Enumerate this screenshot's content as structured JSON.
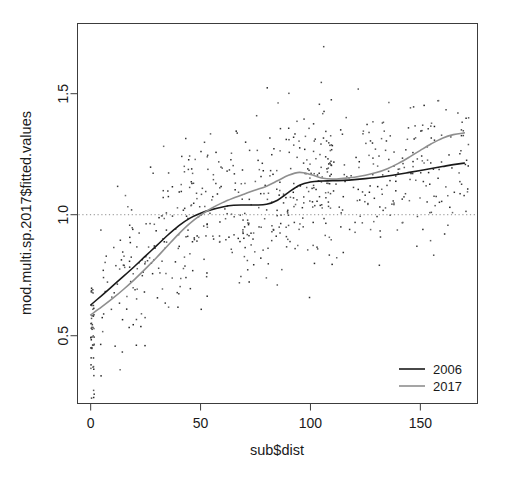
{
  "chart_data": {
    "type": "scatter",
    "title": "",
    "xlabel": "sub$dist",
    "ylabel": "mod.multi.sp.2017$fitted.values",
    "xlim": [
      -6,
      176
    ],
    "ylim": [
      0.22,
      1.79
    ],
    "xticks": [
      0,
      50,
      100,
      150
    ],
    "xtick_labels": [
      "0",
      "50",
      "100",
      "150"
    ],
    "yticks": [
      0.5,
      1.0,
      1.5
    ],
    "ytick_labels": [
      "0.5",
      "1.0",
      "1.5"
    ],
    "grid": false,
    "box": true,
    "reference_line": {
      "name": "unity-reference",
      "orientation": "horizontal",
      "y": 1.0,
      "style": "dotted",
      "color": "#8c8c8c"
    },
    "legend": {
      "position": "bottom-right",
      "entries": [
        {
          "label": "2006",
          "color": "#1a1a1a"
        },
        {
          "label": "2017",
          "color": "#8f8f8f"
        }
      ]
    },
    "series": [
      {
        "name": "2006",
        "type": "line",
        "color": "#1a1a1a",
        "width": 1.6,
        "x": [
          0,
          5,
          10,
          15,
          20,
          25,
          30,
          35,
          40,
          45,
          50,
          55,
          60,
          65,
          70,
          75,
          80,
          85,
          90,
          95,
          100,
          105,
          110,
          115,
          120,
          125,
          130,
          135,
          140,
          145,
          150,
          155,
          160,
          165,
          170
        ],
        "values": [
          0.627,
          0.666,
          0.706,
          0.746,
          0.787,
          0.83,
          0.872,
          0.915,
          0.954,
          0.985,
          1.006,
          1.021,
          1.032,
          1.039,
          1.04,
          1.04,
          1.043,
          1.06,
          1.092,
          1.122,
          1.135,
          1.139,
          1.14,
          1.142,
          1.145,
          1.149,
          1.154,
          1.16,
          1.167,
          1.175,
          1.183,
          1.191,
          1.199,
          1.207,
          1.213
        ]
      },
      {
        "name": "2017",
        "type": "line",
        "color": "#8f8f8f",
        "width": 1.6,
        "x": [
          0,
          5,
          10,
          15,
          20,
          25,
          30,
          35,
          40,
          45,
          50,
          55,
          60,
          65,
          70,
          75,
          80,
          85,
          90,
          95,
          100,
          105,
          110,
          115,
          120,
          125,
          130,
          135,
          140,
          145,
          150,
          155,
          160,
          165,
          170
        ],
        "values": [
          0.586,
          0.619,
          0.654,
          0.692,
          0.733,
          0.777,
          0.823,
          0.872,
          0.92,
          0.963,
          0.998,
          1.027,
          1.05,
          1.069,
          1.086,
          1.102,
          1.118,
          1.14,
          1.163,
          1.175,
          1.166,
          1.152,
          1.147,
          1.15,
          1.155,
          1.163,
          1.174,
          1.19,
          1.212,
          1.238,
          1.266,
          1.293,
          1.316,
          1.331,
          1.338
        ]
      },
      {
        "name": "observations",
        "type": "scatter",
        "color": "#3a3a3a",
        "marker": "small-dot",
        "n_points": 700,
        "note": "dense point cloud, heaviest between x=20 and x=110, vertical stack of low values at x=0"
      }
    ]
  },
  "figure": {
    "device": "r-base-plot",
    "background": "#ffffff"
  }
}
